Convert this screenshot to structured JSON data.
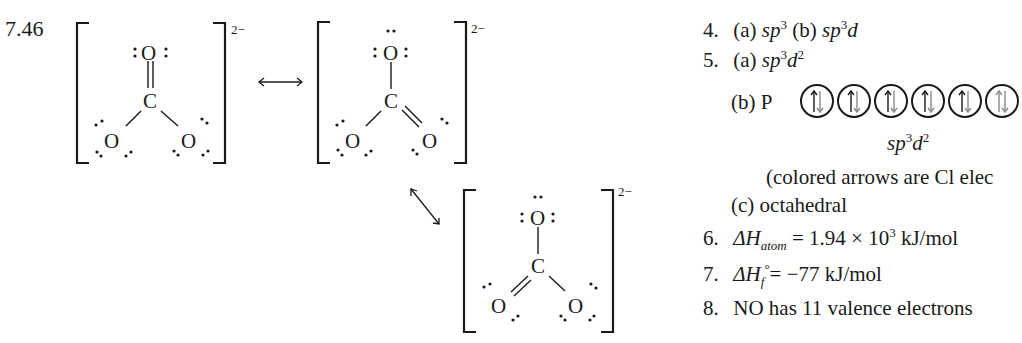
{
  "problem_label": "7.46",
  "resonance": {
    "charge": "2−",
    "atoms": {
      "oxygen": "O",
      "carbon": "C"
    },
    "structures": [
      {
        "id": 1,
        "double_bond_to": "top-O"
      },
      {
        "id": 2,
        "double_bond_to": "bottom-right-O"
      },
      {
        "id": 3,
        "double_bond_to": "bottom-left-O"
      }
    ],
    "arrows": [
      "double-headed-horizontal",
      "double-headed-diagonal"
    ]
  },
  "answers": {
    "q4": {
      "num": "4.",
      "a_label": "(a)",
      "a_val": "sp",
      "a_sup": "3",
      "b_label": "(b)",
      "b_val": "sp",
      "b_sup": "3",
      "b_tail": "d"
    },
    "q5": {
      "num": "5.",
      "a_label": "(a)",
      "a_val": "sp",
      "a_sup": "3",
      "a_tail": "d",
      "a_sup2": "2",
      "b_label": "(b) P",
      "orbitals": {
        "count": 6,
        "electrons_each": "↑↓",
        "black_color": "#1a1a1a",
        "colored_color": "#8a8a8a"
      },
      "orbital_caption": "sp",
      "orbital_caption_sup": "3",
      "orbital_caption_tail": "d",
      "orbital_caption_sup2": "2",
      "note": "(colored arrows are Cl elec",
      "c_text": "(c) octahedral"
    },
    "q6": {
      "num": "6.",
      "delta": "ΔH",
      "sub": "atom",
      "rest": " = 1.94 × 10",
      "sup": "3",
      "unit": " kJ/mol"
    },
    "q7": {
      "num": "7.",
      "delta": "ΔH",
      "sub": "f",
      "degree": "°",
      "rest": "= −77 kJ/mol"
    },
    "q8": {
      "num": "8.",
      "text": "NO has 11 valence electrons"
    }
  }
}
